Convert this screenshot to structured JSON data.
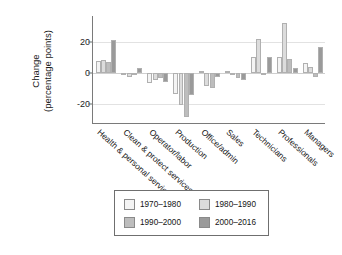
{
  "chart_data": {
    "type": "bar",
    "title": "",
    "subtitle": "",
    "xlabel": "",
    "ylabel": "Change\n(percentage points)",
    "ylabel_line1": "Change",
    "ylabel_line2": "(percentage points)",
    "ylim": [
      -30,
      34
    ],
    "yticks": [
      20,
      0,
      -20
    ],
    "ytick_labels": [
      "20",
      "0",
      "-20"
    ],
    "grid": "horizontal-light",
    "legend_position": "below-axes",
    "categories": [
      "Health & personal services",
      "Clean & protect services",
      "Operator/labor",
      "Production",
      "Office/admin",
      "Sales",
      "Technicians",
      "Professionals",
      "Managers"
    ],
    "series": [
      {
        "name": "1970–1980",
        "color": "#f4f4f4",
        "values": [
          7.5,
          -1.5,
          -6.5,
          -13.5,
          1.5,
          1.5,
          10.5,
          10.5,
          6.5
        ]
      },
      {
        "name": "1980–1990",
        "color": "#dcdcdc",
        "values": [
          8.5,
          -2.5,
          -4.5,
          -20.5,
          -8.5,
          -1.0,
          22.0,
          32.5,
          4.0
        ]
      },
      {
        "name": "1990–2000",
        "color": "#bdbdbd",
        "values": [
          7.0,
          -1.0,
          -3.5,
          -28.5,
          -9.5,
          -3.5,
          -1.5,
          9.0,
          -2.5
        ]
      },
      {
        "name": "2000–2016",
        "color": "#9a9a9a",
        "values": [
          21.5,
          3.0,
          -5.5,
          -14.5,
          -2.5,
          -4.5,
          10.5,
          3.5,
          16.5
        ]
      }
    ]
  },
  "legend": {
    "entries": [
      {
        "label": "1970–1980",
        "color": "#f4f4f4"
      },
      {
        "label": "1980–1990",
        "color": "#dcdcdc"
      },
      {
        "label": "1990–2000",
        "color": "#bdbdbd"
      },
      {
        "label": "2000–2016",
        "color": "#9a9a9a"
      }
    ]
  },
  "axis": {
    "ytick_0": "20",
    "ytick_1": "0",
    "ytick_2": "-20"
  }
}
